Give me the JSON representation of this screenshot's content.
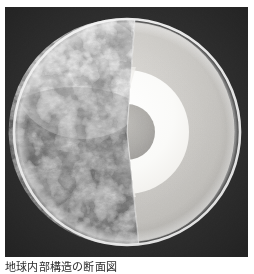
{
  "figure": {
    "name": "earth-interior-cutaway",
    "caption": "地球内部構造の断面図",
    "background_color": "#2f2f2f",
    "page_background": "#ffffff",
    "plate": {
      "x": 5,
      "y": 7,
      "width": 243,
      "height": 250
    }
  },
  "diagram": {
    "type": "cutaway-cross-section",
    "center": {
      "x": 122,
      "y": 125
    },
    "radius": 113,
    "cut_wedge": {
      "description": "A pie-shaped wedge removed from the front-right of the globe exposing the concentric interior layers",
      "apex_angle_deg": 92,
      "start_angle_deg": -86,
      "end_angle_deg": 84
    },
    "rim": {
      "label": "outer limb highlight",
      "color": "#ffffff",
      "width_px": 3
    },
    "layers": [
      {
        "id": "surface",
        "label": "Surface (satellite imagery)",
        "kind": "photographic",
        "radius_ratio": 1.0,
        "color": "#d8d8d8",
        "description": "Grayscale satellite photo of clouds, ocean and continents on the intact hemisphere"
      },
      {
        "id": "crust",
        "label": "Crust",
        "kind": "shell",
        "radius_ratio": 0.975,
        "color": "#f4f4f2",
        "thickness_ratio": 0.025
      },
      {
        "id": "mantle",
        "label": "Mantle",
        "kind": "shell",
        "radius_ratio": 0.95,
        "color": "#c9c9c6",
        "thickness_ratio": 0.4
      },
      {
        "id": "outer-core",
        "label": "Outer core",
        "kind": "shell",
        "radius_ratio": 0.55,
        "color": "#fbfbfa",
        "thickness_ratio": 0.3
      },
      {
        "id": "inner-core",
        "label": "Inner core",
        "kind": "core",
        "radius_ratio": 0.25,
        "color": "#a9a9a6"
      }
    ],
    "cut_face": {
      "label": "Flat cut face of the wedge",
      "bands": [
        {
          "id": "cut-mantle",
          "color": "#bdbdba"
        },
        {
          "id": "cut-crust-edge",
          "color": "#ffffff"
        },
        {
          "id": "cut-outer-core",
          "color": "#ededea"
        }
      ]
    }
  }
}
